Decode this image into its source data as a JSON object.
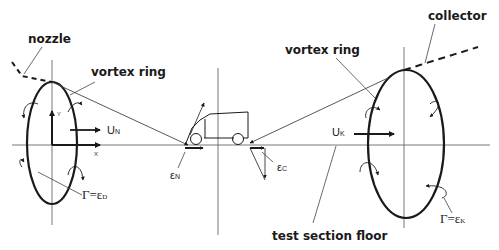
{
  "diagram": {
    "labels": {
      "nozzle": "nozzle",
      "collector": "collector",
      "vortex_ring_left": "vortex ring",
      "vortex_ring_right": "vortex ring",
      "test_section_floor": "test section floor"
    },
    "symbols": {
      "u_n": "U",
      "u_n_sub": "N",
      "u_k": "U",
      "u_k_sub": "K",
      "eps_n": "ε",
      "eps_n_sub": "N",
      "eps_c": "ε",
      "eps_c_sub": "C",
      "gamma_d": "Γ=ε",
      "gamma_d_sub": "D",
      "gamma_k": "Γ=ε",
      "gamma_k_sub": "K",
      "axis_x": "X",
      "axis_y": "Y"
    },
    "colors": {
      "line": "#1a1a1a",
      "thin": "#444444",
      "background": "#ffffff"
    }
  }
}
